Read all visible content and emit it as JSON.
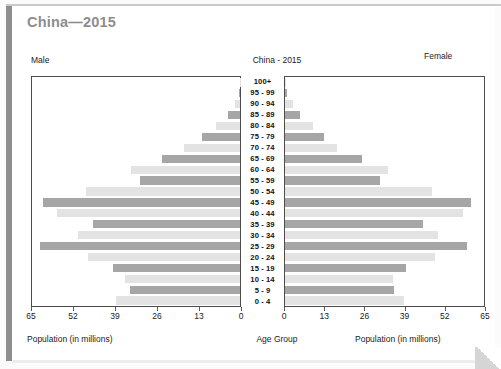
{
  "page": {
    "heading": "China—2015"
  },
  "chart": {
    "title": "China - 2015",
    "left_side_label": "Male",
    "right_side_label": "Female",
    "left_axis_title": "Population (in millions)",
    "center_axis_title": "Age Group",
    "right_axis_title": "Population (in millions)",
    "left_ticks": [
      "65",
      "52",
      "39",
      "26",
      "13",
      "0"
    ],
    "right_ticks": [
      "0",
      "13",
      "26",
      "39",
      "52",
      "65"
    ]
  },
  "chart_data": {
    "type": "bar",
    "subtype": "population-pyramid",
    "title": "China - 2015",
    "xlabel": "Population (in millions)",
    "ylabel": "Age Group",
    "xlim": [
      0,
      65
    ],
    "grid": false,
    "legend": "none",
    "categories": [
      "100+",
      "95 - 99",
      "90 - 94",
      "85 - 89",
      "80 - 84",
      "75 - 79",
      "70 - 74",
      "65 - 69",
      "60 - 64",
      "55 - 59",
      "50 - 54",
      "45 - 49",
      "40 - 44",
      "35 - 39",
      "30 - 34",
      "25 - 29",
      "20 - 24",
      "15 - 19",
      "10 - 14",
      "5 - 9",
      "0 - 4"
    ],
    "series": [
      {
        "name": "Male",
        "side": "left",
        "color_light": "#e3e3e3",
        "color_dark": "#a6a6a6",
        "values": [
          0.1,
          0.4,
          1.6,
          3.6,
          7.6,
          12.0,
          17.6,
          24.4,
          34.0,
          31.4,
          48.2,
          61.6,
          57.2,
          46.0,
          50.6,
          62.6,
          47.4,
          39.6,
          36.0,
          34.4,
          38.6
        ]
      },
      {
        "name": "Female",
        "side": "right",
        "color_light": "#e3e3e3",
        "color_dark": "#a6a6a6",
        "values": [
          0.1,
          0.6,
          2.6,
          5.0,
          9.0,
          12.6,
          17.0,
          25.2,
          33.6,
          31.0,
          48.0,
          60.6,
          58.0,
          45.2,
          50.0,
          59.6,
          49.0,
          39.6,
          35.2,
          35.6,
          39.0
        ]
      }
    ],
    "bar_color_even": "#e3e3e3",
    "bar_color_odd": "#a6a6a6",
    "axis_color": "#4d4d4d"
  }
}
